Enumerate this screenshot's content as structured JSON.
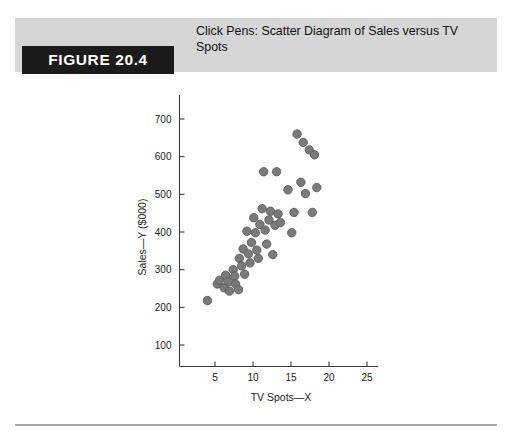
{
  "figure": {
    "tag_label": "FIGURE 20.4",
    "caption": "Click Pens: Scatter Diagram of Sales versus TV Spots"
  },
  "colors": {
    "band_background": "#d6d6d6",
    "tag_background": "#1b1b1b",
    "tag_text": "#ffffff",
    "marker_fill": "#7a7a7a",
    "marker_stroke": "#5c5c5c",
    "axis": "#3a3a3a",
    "footer_rule": "#a9a9ad"
  },
  "chart_data": {
    "type": "scatter",
    "title": "Click Pens: Scatter Diagram of Sales versus TV Spots",
    "xlabel": "TV Spots—X",
    "ylabel": "Sales—Y ($000)",
    "xlim": [
      0,
      27
    ],
    "ylim": [
      0,
      760
    ],
    "xticks": [
      5,
      10,
      15,
      20,
      25
    ],
    "yticks": [
      100,
      200,
      300,
      400,
      500,
      600,
      700
    ],
    "xtick_labels": [
      "5",
      "10",
      "15",
      "20",
      "25"
    ],
    "ytick_labels": [
      "100",
      "200",
      "300",
      "400",
      "500",
      "600",
      "700"
    ],
    "grid": false,
    "legend": false,
    "marker_radius_px": 4.2,
    "points": [
      {
        "x": 4.0,
        "y": 218
      },
      {
        "x": 5.3,
        "y": 262
      },
      {
        "x": 5.6,
        "y": 272
      },
      {
        "x": 6.2,
        "y": 252
      },
      {
        "x": 6.4,
        "y": 285
      },
      {
        "x": 6.8,
        "y": 268
      },
      {
        "x": 6.9,
        "y": 243
      },
      {
        "x": 7.4,
        "y": 300
      },
      {
        "x": 7.6,
        "y": 283
      },
      {
        "x": 7.7,
        "y": 262
      },
      {
        "x": 8.1,
        "y": 247
      },
      {
        "x": 8.2,
        "y": 330
      },
      {
        "x": 8.5,
        "y": 310
      },
      {
        "x": 8.7,
        "y": 355
      },
      {
        "x": 8.9,
        "y": 288
      },
      {
        "x": 9.2,
        "y": 402
      },
      {
        "x": 9.4,
        "y": 342
      },
      {
        "x": 9.6,
        "y": 318
      },
      {
        "x": 9.8,
        "y": 372
      },
      {
        "x": 10.1,
        "y": 438
      },
      {
        "x": 10.3,
        "y": 398
      },
      {
        "x": 10.5,
        "y": 352
      },
      {
        "x": 10.7,
        "y": 330
      },
      {
        "x": 10.9,
        "y": 420
      },
      {
        "x": 11.2,
        "y": 462
      },
      {
        "x": 11.4,
        "y": 560
      },
      {
        "x": 11.6,
        "y": 405
      },
      {
        "x": 11.8,
        "y": 368
      },
      {
        "x": 12.1,
        "y": 432
      },
      {
        "x": 12.3,
        "y": 455
      },
      {
        "x": 12.6,
        "y": 340
      },
      {
        "x": 12.9,
        "y": 418
      },
      {
        "x": 13.1,
        "y": 560
      },
      {
        "x": 13.3,
        "y": 448
      },
      {
        "x": 13.6,
        "y": 425
      },
      {
        "x": 14.6,
        "y": 512
      },
      {
        "x": 15.1,
        "y": 398
      },
      {
        "x": 15.4,
        "y": 452
      },
      {
        "x": 15.8,
        "y": 660
      },
      {
        "x": 16.3,
        "y": 532
      },
      {
        "x": 16.6,
        "y": 638
      },
      {
        "x": 16.9,
        "y": 502
      },
      {
        "x": 17.4,
        "y": 618
      },
      {
        "x": 17.8,
        "y": 452
      },
      {
        "x": 18.1,
        "y": 605
      },
      {
        "x": 18.4,
        "y": 518
      }
    ]
  }
}
